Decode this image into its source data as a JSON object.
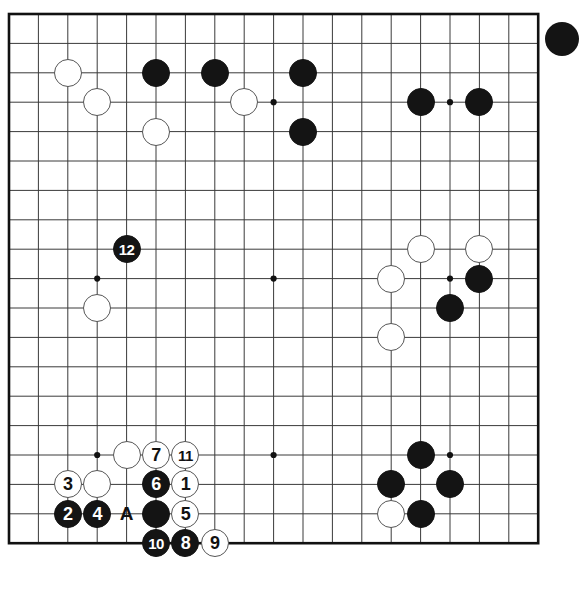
{
  "diagram": {
    "type": "go-board-diagram",
    "board_size": 19,
    "title": "",
    "colors": {
      "line": "#3a3a3a",
      "border": "#111111",
      "black_stone": "#141414",
      "white_stone": "#ffffff",
      "background": "#ffffff"
    },
    "geometry": {
      "left": 9,
      "top": 14,
      "spacing": 29.4,
      "stone_radius": 14.0,
      "board_px": 529.2
    },
    "star_points": [
      {
        "col": 4,
        "row": 4
      },
      {
        "col": 10,
        "row": 4
      },
      {
        "col": 16,
        "row": 4
      },
      {
        "col": 4,
        "row": 10
      },
      {
        "col": 10,
        "row": 10
      },
      {
        "col": 16,
        "row": 10
      },
      {
        "col": 4,
        "row": 16
      },
      {
        "col": 10,
        "row": 16
      },
      {
        "col": 16,
        "row": 16
      }
    ],
    "stones": [
      {
        "col": 3,
        "row": 3,
        "color": "white",
        "label": ""
      },
      {
        "col": 4,
        "row": 4,
        "color": "white",
        "label": ""
      },
      {
        "col": 6,
        "row": 3,
        "color": "black",
        "label": ""
      },
      {
        "col": 6,
        "row": 5,
        "color": "white",
        "label": ""
      },
      {
        "col": 8,
        "row": 3,
        "color": "black",
        "label": ""
      },
      {
        "col": 9,
        "row": 4,
        "color": "white",
        "label": ""
      },
      {
        "col": 11,
        "row": 3,
        "color": "black",
        "label": ""
      },
      {
        "col": 11,
        "row": 5,
        "color": "black",
        "label": ""
      },
      {
        "col": 15,
        "row": 4,
        "color": "black",
        "label": ""
      },
      {
        "col": 17,
        "row": 4,
        "color": "black",
        "label": ""
      },
      {
        "col": 5,
        "row": 9,
        "color": "black",
        "label": "12"
      },
      {
        "col": 4,
        "row": 11,
        "color": "white",
        "label": ""
      },
      {
        "col": 15,
        "row": 9,
        "color": "white",
        "label": ""
      },
      {
        "col": 17,
        "row": 9,
        "color": "white",
        "label": ""
      },
      {
        "col": 14,
        "row": 10,
        "color": "white",
        "label": ""
      },
      {
        "col": 17,
        "row": 10,
        "color": "black",
        "label": ""
      },
      {
        "col": 16,
        "row": 11,
        "color": "black",
        "label": ""
      },
      {
        "col": 14,
        "row": 12,
        "color": "white",
        "label": ""
      },
      {
        "col": 5,
        "row": 16,
        "color": "white",
        "label": ""
      },
      {
        "col": 6,
        "row": 16,
        "color": "white",
        "label": "7"
      },
      {
        "col": 7,
        "row": 16,
        "color": "white",
        "label": "11"
      },
      {
        "col": 3,
        "row": 17,
        "color": "white",
        "label": "3"
      },
      {
        "col": 4,
        "row": 17,
        "color": "white",
        "label": ""
      },
      {
        "col": 6,
        "row": 17,
        "color": "black",
        "label": "6"
      },
      {
        "col": 7,
        "row": 17,
        "color": "white",
        "label": "1"
      },
      {
        "col": 3,
        "row": 18,
        "color": "black",
        "label": "2"
      },
      {
        "col": 4,
        "row": 18,
        "color": "black",
        "label": "4"
      },
      {
        "col": 6,
        "row": 18,
        "color": "black",
        "label": ""
      },
      {
        "col": 7,
        "row": 18,
        "color": "white",
        "label": "5"
      },
      {
        "col": 6,
        "row": 19,
        "color": "black",
        "label": "10"
      },
      {
        "col": 7,
        "row": 19,
        "color": "black",
        "label": "8"
      },
      {
        "col": 8,
        "row": 19,
        "color": "white",
        "label": "9"
      },
      {
        "col": 15,
        "row": 16,
        "color": "black",
        "label": ""
      },
      {
        "col": 14,
        "row": 17,
        "color": "black",
        "label": ""
      },
      {
        "col": 16,
        "row": 17,
        "color": "black",
        "label": ""
      },
      {
        "col": 14,
        "row": 18,
        "color": "white",
        "label": ""
      },
      {
        "col": 15,
        "row": 18,
        "color": "black",
        "label": ""
      }
    ],
    "point_labels": [
      {
        "col": 5,
        "row": 18,
        "text": "A"
      }
    ],
    "move_numbers": [
      "1",
      "2",
      "3",
      "4",
      "5",
      "6",
      "7",
      "8",
      "9",
      "10",
      "11",
      "12"
    ]
  }
}
